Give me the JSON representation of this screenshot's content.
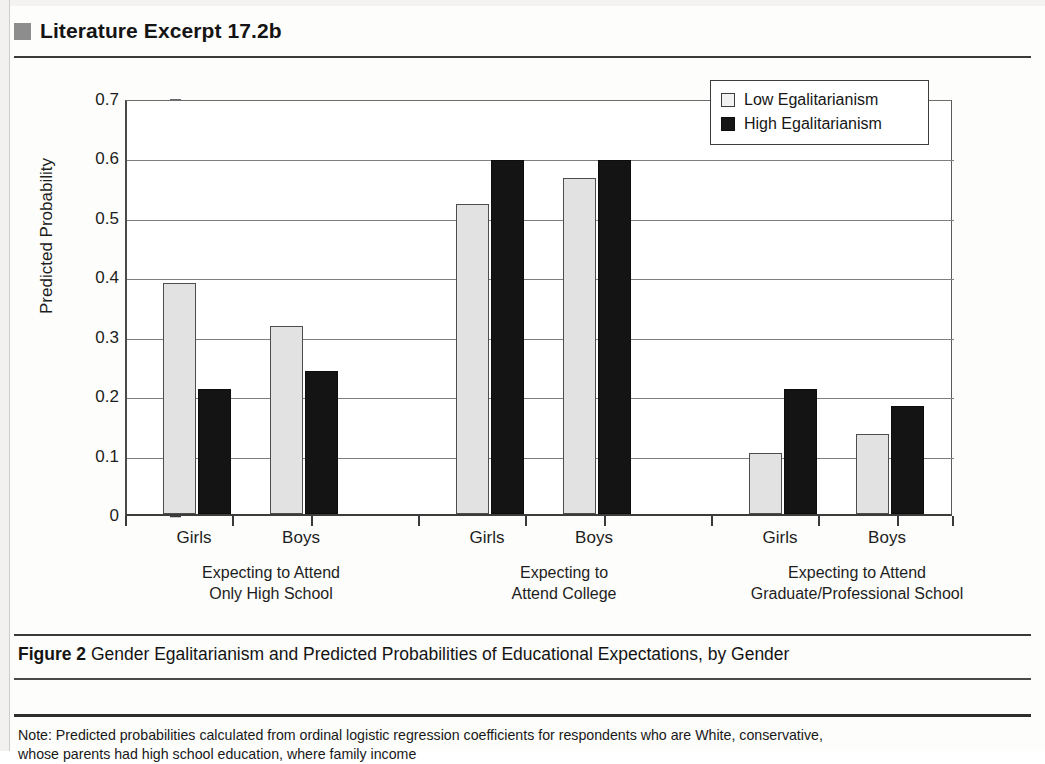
{
  "header": {
    "bullet_icon": "square-bullet-icon",
    "title": "Literature Excerpt 17.2b",
    "bullet_color": "#8d8d8d"
  },
  "caption": {
    "figure_label": "Figure 2",
    "text": "Gender Egalitarianism and Predicted Probabilities of Educational Expectations, by Gender"
  },
  "note": {
    "line1": "Note: Predicted probabilities calculated from ordinal logistic regression coefficients for respondents who are White, conservative,",
    "line2": "whose parents had high school education, where family income"
  },
  "chart_data": {
    "type": "bar",
    "title": "",
    "xlabel": "",
    "ylabel": "Predicted Probability",
    "ylim": [
      0,
      0.7
    ],
    "ytick_labels": [
      "0.7",
      "0.6",
      "0.5",
      "0.4",
      "0.3",
      "0.2",
      "0.1",
      "0"
    ],
    "ytick_values": [
      0.7,
      0.6,
      0.5,
      0.4,
      0.3,
      0.2,
      0.1,
      0
    ],
    "grid": true,
    "legend_position": "top-right",
    "legend": [
      "Low Egalitarianism",
      "High Egalitarianism"
    ],
    "colors": {
      "low": "#e2e2e2",
      "high": "#141414",
      "axis": "#3a3a3a"
    },
    "categories": [
      "Girls",
      "Boys",
      "Girls",
      "Boys",
      "Girls",
      "Boys"
    ],
    "groups": [
      {
        "label_line1": "Expecting to Attend",
        "label_line2": "Only High School",
        "bars": [
          {
            "gender": "Girls",
            "low": 0.389,
            "high": 0.21
          },
          {
            "gender": "Boys",
            "low": 0.316,
            "high": 0.241
          }
        ]
      },
      {
        "label_line1": "Expecting to",
        "label_line2": "Attend College",
        "bars": [
          {
            "gender": "Girls",
            "low": 0.522,
            "high": 0.596
          },
          {
            "gender": "Boys",
            "low": 0.565,
            "high": 0.596
          }
        ]
      },
      {
        "label_line1": "Expecting to Attend",
        "label_line2": "Graduate/Professional  School",
        "bars": [
          {
            "gender": "Girls",
            "low": 0.103,
            "high": 0.21
          },
          {
            "gender": "Boys",
            "low": 0.135,
            "high": 0.182
          }
        ]
      }
    ],
    "series": [
      {
        "name": "Low Egalitarianism",
        "values": [
          0.389,
          0.316,
          0.522,
          0.565,
          0.103,
          0.135
        ]
      },
      {
        "name": "High Egalitarianism",
        "values": [
          0.21,
          0.241,
          0.596,
          0.596,
          0.21,
          0.182
        ]
      }
    ]
  }
}
